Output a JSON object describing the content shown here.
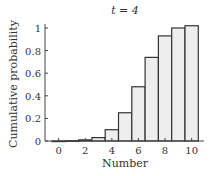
{
  "chart_data": {
    "type": "bar",
    "title": "t = 4",
    "xlabel": "Number",
    "ylabel": "Cumulative probability",
    "categories": [
      0,
      1,
      2,
      3,
      4,
      5,
      6,
      7,
      8,
      9,
      10
    ],
    "values": [
      0.0,
      0.002,
      0.01,
      0.03,
      0.1,
      0.25,
      0.48,
      0.74,
      0.93,
      1.0,
      1.02
    ],
    "xticks": [
      0,
      2,
      4,
      6,
      8,
      10
    ],
    "xtick_labels": [
      "0",
      "2",
      "4",
      "6",
      "8",
      "10"
    ],
    "yticks": [
      0,
      0.2,
      0.4,
      0.6,
      0.8,
      1
    ],
    "ytick_labels": [
      "0",
      "0.2",
      "0.4",
      "0.6",
      "0.8",
      "1"
    ],
    "ylim": [
      0,
      1.05
    ],
    "xlim": [
      -0.5,
      10.5
    ],
    "grid": false,
    "legend": null,
    "bar_fill": "#eeeeee",
    "bar_edge": "#333333"
  }
}
